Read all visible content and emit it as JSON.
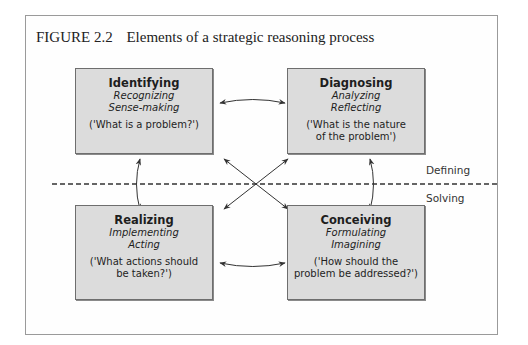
{
  "figure": {
    "number": "FIGURE 2.2",
    "title": "Elements of a strategic reasoning process"
  },
  "boxes": {
    "top_left": {
      "heading": "Identifying",
      "sub1": "Recognizing",
      "sub2": "Sense-making",
      "question": "('What is a problem?')"
    },
    "top_right": {
      "heading": "Diagnosing",
      "sub1": "Analyzing",
      "sub2": "Reflecting",
      "question_line1": "('What is the nature",
      "question_line2": "of the problem')"
    },
    "bottom_left": {
      "heading": "Realizing",
      "sub1": "Implementing",
      "sub2": "Acting",
      "question_line1": "('What actions should",
      "question_line2": "be taken?')"
    },
    "bottom_right": {
      "heading": "Conceiving",
      "sub1": "Formulating",
      "sub2": "Imagining",
      "question_line1": "('How should the",
      "question_line2": "problem be addressed?')"
    }
  },
  "zones": {
    "upper": "Defining",
    "lower": "Solving"
  },
  "connections": [
    {
      "from": "Identifying",
      "to": "Diagnosing",
      "type": "bidirectional"
    },
    {
      "from": "Identifying",
      "to": "Realizing",
      "type": "bidirectional"
    },
    {
      "from": "Diagnosing",
      "to": "Conceiving",
      "type": "bidirectional"
    },
    {
      "from": "Realizing",
      "to": "Conceiving",
      "type": "bidirectional"
    },
    {
      "from": "Identifying",
      "to": "Conceiving",
      "type": "bidirectional"
    },
    {
      "from": "Diagnosing",
      "to": "Realizing",
      "type": "bidirectional"
    }
  ],
  "colors": {
    "box_fill": "#dcdcdc",
    "box_border": "#6e6e6e",
    "arrow": "#333333",
    "divider": "#333333"
  }
}
